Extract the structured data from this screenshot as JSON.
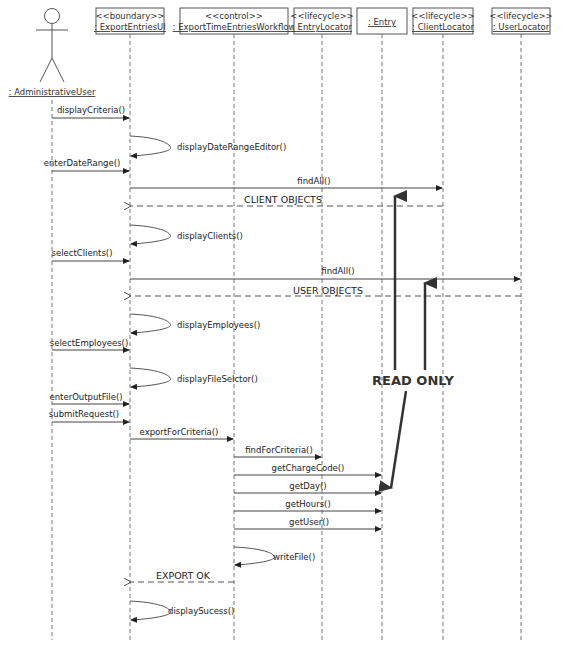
{
  "diagram": {
    "type": "UML sequence diagram",
    "actor": {
      "label": ": AdministrativeUser"
    },
    "participants": [
      {
        "id": "ui",
        "stereotype": "<<boundary>>",
        "name": ": ExportEntriesUI"
      },
      {
        "id": "wf",
        "stereotype": "<<control>>",
        "name": ": ExportTimeEntriesWorkflow"
      },
      {
        "id": "el",
        "stereotype": "<<lifecycle>>",
        "name": ": EntryLocator"
      },
      {
        "id": "en",
        "stereotype": "",
        "name": ": Entry"
      },
      {
        "id": "cl",
        "stereotype": "<<lifecycle>>",
        "name": ": ClientLocator"
      },
      {
        "id": "ul",
        "stereotype": "<<lifecycle>>",
        "name": ": UserLocator"
      }
    ],
    "messages": [
      {
        "label": "displayCriteria()",
        "from": "actor",
        "to": "ui",
        "kind": "call"
      },
      {
        "label": "displayDateRangeEditor()",
        "from": "ui",
        "to": "ui",
        "kind": "self"
      },
      {
        "label": "enterDateRange()",
        "from": "actor",
        "to": "ui",
        "kind": "call"
      },
      {
        "label": "findAll()",
        "from": "ui",
        "to": "cl",
        "kind": "call"
      },
      {
        "label": "CLIENT OBJECTS",
        "from": "cl",
        "to": "ui",
        "kind": "return"
      },
      {
        "label": "displayClients()",
        "from": "ui",
        "to": "ui",
        "kind": "self"
      },
      {
        "label": "selectClients()",
        "from": "actor",
        "to": "ui",
        "kind": "call"
      },
      {
        "label": "findAll()",
        "from": "ui",
        "to": "ul",
        "kind": "call"
      },
      {
        "label": "USER OBJECTS",
        "from": "ul",
        "to": "ui",
        "kind": "return"
      },
      {
        "label": "displayEmployees()",
        "from": "ui",
        "to": "ui",
        "kind": "self"
      },
      {
        "label": "selectEmployees()",
        "from": "actor",
        "to": "ui",
        "kind": "call"
      },
      {
        "label": "displayFileSelctor()",
        "from": "ui",
        "to": "ui",
        "kind": "self"
      },
      {
        "label": "enterOutputFile()",
        "from": "actor",
        "to": "ui",
        "kind": "call"
      },
      {
        "label": "submitRequest()",
        "from": "actor",
        "to": "ui",
        "kind": "call"
      },
      {
        "label": "exportForCriteria()",
        "from": "ui",
        "to": "wf",
        "kind": "call"
      },
      {
        "label": "findForCriteria()",
        "from": "wf",
        "to": "el",
        "kind": "call"
      },
      {
        "label": "getChargeCode()",
        "from": "wf",
        "to": "en",
        "kind": "call"
      },
      {
        "label": "getDay()",
        "from": "wf",
        "to": "en",
        "kind": "call"
      },
      {
        "label": "getHours()",
        "from": "wf",
        "to": "en",
        "kind": "call"
      },
      {
        "label": "getUser()",
        "from": "wf",
        "to": "en",
        "kind": "call"
      },
      {
        "label": "writeFile()",
        "from": "wf",
        "to": "wf",
        "kind": "self"
      },
      {
        "label": "EXPORT OK",
        "from": "wf",
        "to": "ui",
        "kind": "return"
      },
      {
        "label": "displaySucess()",
        "from": "ui",
        "to": "ui",
        "kind": "self"
      }
    ],
    "annotation": {
      "label": "READ ONLY"
    }
  }
}
